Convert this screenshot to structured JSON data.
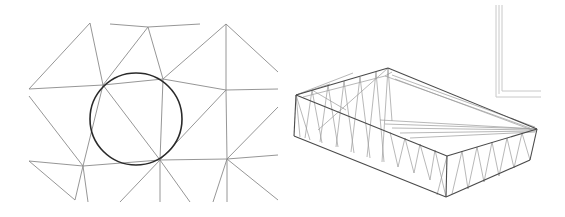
{
  "figure": {
    "panels": [
      {
        "id": "delaunay-mesh",
        "description": "2D triangular mesh with a circumscribed circle",
        "stroke_color": "#8a8a8a",
        "circle": {
          "cx": 136,
          "cy": 119,
          "r": 46,
          "stroke": "#2a2a2a"
        },
        "edges": [
          [
            29,
            89,
            90,
            23
          ],
          [
            90,
            23,
            103,
            85
          ],
          [
            29,
            89,
            103,
            85
          ],
          [
            103,
            85,
            163,
            79
          ],
          [
            163,
            79,
            226,
            90
          ],
          [
            226,
            90,
            278,
            89
          ],
          [
            110,
            24,
            148,
            27
          ],
          [
            148,
            27,
            200,
            24
          ],
          [
            148,
            27,
            103,
            85
          ],
          [
            148,
            27,
            163,
            79
          ],
          [
            163,
            79,
            226,
            24
          ],
          [
            226,
            24,
            226,
            90
          ],
          [
            226,
            24,
            278,
            72
          ],
          [
            29,
            96,
            83,
            166
          ],
          [
            103,
            85,
            83,
            166
          ],
          [
            103,
            85,
            160,
            160
          ],
          [
            83,
            166,
            160,
            160
          ],
          [
            160,
            160,
            227,
            159
          ],
          [
            227,
            159,
            278,
            155
          ],
          [
            163,
            79,
            160,
            160
          ],
          [
            160,
            160,
            226,
            90
          ],
          [
            226,
            90,
            227,
            159
          ],
          [
            227,
            159,
            278,
            107
          ],
          [
            29,
            161,
            75,
            200
          ],
          [
            29,
            161,
            83,
            166
          ],
          [
            83,
            166,
            75,
            200
          ],
          [
            83,
            166,
            88,
            202
          ],
          [
            160,
            160,
            120,
            202
          ],
          [
            160,
            160,
            160,
            202
          ],
          [
            160,
            160,
            190,
            202
          ],
          [
            227,
            159,
            213,
            202
          ],
          [
            227,
            159,
            227,
            202
          ],
          [
            227,
            159,
            278,
            200
          ]
        ]
      },
      {
        "id": "wireframe-box",
        "description": "3D wireframe tray / sloped box with triangulated side walls",
        "stroke_color": "#9a9a9a",
        "edge_color": "#4a4a4a",
        "outline_edges": [
          [
            296,
            95,
            388,
            68
          ],
          [
            296,
            95,
            447,
            156
          ],
          [
            447,
            156,
            537,
            129
          ],
          [
            388,
            68,
            537,
            129
          ],
          [
            296,
            95,
            294,
            136
          ],
          [
            294,
            136,
            446,
            197
          ],
          [
            446,
            197,
            447,
            156
          ],
          [
            446,
            197,
            530,
            160
          ],
          [
            530,
            160,
            537,
            129
          ]
        ],
        "inner_edges": [
          [
            303,
            97,
            385,
            76
          ],
          [
            385,
            76,
            530,
            128
          ],
          [
            385,
            76,
            392,
            72
          ],
          [
            392,
            75,
            535,
            127
          ],
          [
            395,
            79,
            532,
            130
          ],
          [
            380,
            120,
            537,
            129
          ],
          [
            385,
            124,
            537,
            129
          ],
          [
            392,
            128,
            536,
            130
          ],
          [
            400,
            133,
            536,
            131
          ],
          [
            410,
            138,
            535,
            132
          ],
          [
            296,
            95,
            353,
            73
          ],
          [
            296,
            95,
            330,
            84
          ]
        ],
        "wall_struts": [
          [
            296,
            95,
            300,
            137
          ],
          [
            296,
            95,
            310,
            140
          ],
          [
            312,
            90,
            305,
            138
          ],
          [
            312,
            90,
            322,
            143
          ],
          [
            312,
            90,
            346,
            110
          ],
          [
            328,
            85,
            320,
            142
          ],
          [
            328,
            85,
            338,
            147
          ],
          [
            344,
            81,
            336,
            147
          ],
          [
            344,
            81,
            354,
            153
          ],
          [
            360,
            77,
            351,
            152
          ],
          [
            360,
            77,
            370,
            158
          ],
          [
            376,
            72,
            367,
            157
          ],
          [
            376,
            72,
            384,
            162
          ],
          [
            388,
            68,
            382,
            162
          ],
          [
            388,
            68,
            392,
            121
          ],
          [
            388,
            68,
            318,
            130
          ],
          [
            390,
            132,
            398,
            167
          ],
          [
            405,
            138,
            398,
            167
          ],
          [
            405,
            138,
            414,
            173
          ],
          [
            420,
            144,
            414,
            173
          ],
          [
            420,
            144,
            430,
            180
          ],
          [
            435,
            150,
            430,
            180
          ],
          [
            435,
            150,
            446,
            197
          ],
          [
            447,
            156,
            437,
            195
          ],
          [
            462,
            151,
            452,
            194
          ],
          [
            462,
            151,
            468,
            189
          ],
          [
            477,
            147,
            468,
            189
          ],
          [
            477,
            147,
            484,
            182
          ],
          [
            492,
            142,
            484,
            182
          ],
          [
            492,
            142,
            499,
            176
          ],
          [
            507,
            138,
            499,
            176
          ],
          [
            507,
            138,
            514,
            168
          ],
          [
            522,
            133,
            514,
            168
          ],
          [
            522,
            133,
            530,
            160
          ]
        ]
      },
      {
        "id": "corner-frame",
        "description": "Partial rectangular frame lines (L-shape) in upper-right corner",
        "stroke_color": "#c8c8c8",
        "lines": [
          [
            496,
            5,
            496,
            97
          ],
          [
            496,
            97,
            541,
            97
          ],
          [
            502,
            5,
            502,
            91
          ],
          [
            502,
            91,
            541,
            91
          ],
          [
            499,
            5,
            499,
            94
          ]
        ]
      }
    ]
  }
}
